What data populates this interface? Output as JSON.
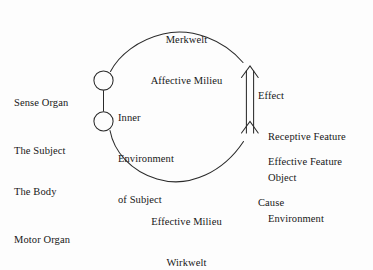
{
  "diagram": {
    "stroke_color": "#2b2b2b",
    "background_color": "#fdfdfd",
    "text_color": "#171717"
  },
  "top_label": {
    "line1": "Merkwelt",
    "line2": "Affective Milieu"
  },
  "bottom_label": {
    "line1": "Effective Milieu",
    "line2": "Wirkwelt"
  },
  "left_label": {
    "line1": "Sense Organ",
    "line2": "The Subject",
    "line3": "The Body",
    "line4": "Motor Organ"
  },
  "inner_label": {
    "line1": "Inner",
    "line2": "Environment",
    "line3": "of Subject"
  },
  "right_upper_label": {
    "line1": "Effect",
    "line2": "Receptive Feature",
    "line3": "Object",
    "line4": "Environment"
  },
  "right_lower_label": {
    "line1": "Effective Feature",
    "line2": "Cause"
  },
  "nodes": {
    "sense_organ_circle": "sense-organ-node",
    "motor_organ_circle": "motor-organ-node",
    "object_bar": "object-bar"
  }
}
